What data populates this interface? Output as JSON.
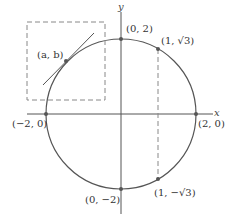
{
  "diagram": {
    "title": "",
    "axes": {
      "x_label": "x",
      "y_label": "y"
    },
    "circle": {
      "center": [
        0,
        0
      ],
      "radius": 2
    },
    "points": [
      {
        "id": "ab",
        "label": "(a, b)"
      },
      {
        "id": "top",
        "label": "(0, 2)"
      },
      {
        "id": "q1",
        "label": "(1, √3)"
      },
      {
        "id": "left",
        "label": "(−2, 0)"
      },
      {
        "id": "right",
        "label": "(2, 0)"
      },
      {
        "id": "bottom",
        "label": "(0, −2)"
      },
      {
        "id": "q4",
        "label": "(1, −√3)"
      }
    ],
    "annotations": {
      "zoom_box": "dashed square around point (a, b) with tangent line",
      "vertical_dashed": "dashed line from (1, √3) to (1, −√3)"
    },
    "colors": {
      "stroke": "#555555",
      "dashed": "#888888",
      "text": "#333333"
    }
  }
}
